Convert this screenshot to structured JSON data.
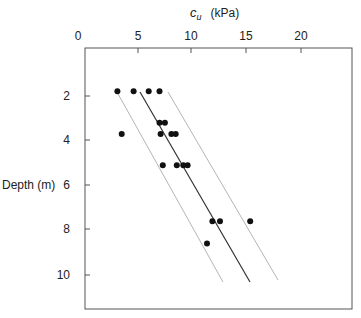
{
  "chart_data": {
    "type": "scatter",
    "title": "",
    "xlabel": "c_u (kPa)",
    "xlabel_symbol": "c",
    "xlabel_subscript": "u",
    "xlabel_units": "(kPa)",
    "ylabel": "Depth (m)",
    "x_axis_position": "top",
    "y_axis_inverted": true,
    "xlim": [
      0,
      24.7
    ],
    "ylim": [
      0,
      11.5
    ],
    "x_ticks": [
      0,
      5,
      10,
      15,
      20
    ],
    "y_ticks": [
      2,
      4,
      6,
      8,
      10
    ],
    "grid": false,
    "legend": null,
    "series": [
      {
        "name": "measured",
        "type": "scatter",
        "points": [
          {
            "x": 3.0,
            "y": 1.8
          },
          {
            "x": 4.5,
            "y": 1.8
          },
          {
            "x": 5.9,
            "y": 1.8
          },
          {
            "x": 6.9,
            "y": 1.8
          },
          {
            "x": 6.9,
            "y": 3.2
          },
          {
            "x": 7.4,
            "y": 3.2
          },
          {
            "x": 3.4,
            "y": 3.7
          },
          {
            "x": 7.0,
            "y": 3.7
          },
          {
            "x": 8.0,
            "y": 3.7
          },
          {
            "x": 8.4,
            "y": 3.7
          },
          {
            "x": 7.2,
            "y": 5.1
          },
          {
            "x": 8.5,
            "y": 5.1
          },
          {
            "x": 9.1,
            "y": 5.1
          },
          {
            "x": 9.5,
            "y": 5.1
          },
          {
            "x": 11.8,
            "y": 7.6
          },
          {
            "x": 12.5,
            "y": 7.6
          },
          {
            "x": 15.3,
            "y": 7.6
          },
          {
            "x": 11.3,
            "y": 8.6
          }
        ]
      },
      {
        "name": "mean trend",
        "type": "line",
        "style": "solid",
        "color": "#333333",
        "points": [
          {
            "x": 5.1,
            "y": 1.8
          },
          {
            "x": 15.3,
            "y": 10.3
          }
        ]
      },
      {
        "name": "lower bound",
        "type": "line",
        "style": "thin",
        "color": "#b0b0b0",
        "points": [
          {
            "x": 3.0,
            "y": 1.8
          },
          {
            "x": 12.8,
            "y": 10.3
          }
        ]
      },
      {
        "name": "upper bound",
        "type": "line",
        "style": "thin",
        "color": "#b0b0b0",
        "points": [
          {
            "x": 7.7,
            "y": 1.8
          },
          {
            "x": 17.9,
            "y": 10.2
          }
        ]
      }
    ]
  },
  "labels": {
    "x_title_symbol": "c",
    "x_title_sub": "u",
    "x_title_units": "(kPa)",
    "y_title": "Depth (m)",
    "x_tick_0": "0",
    "x_tick_5": "5",
    "x_tick_10": "10",
    "x_tick_15": "15",
    "x_tick_20": "20",
    "y_tick_2": "2",
    "y_tick_4": "4",
    "y_tick_6": "6",
    "y_tick_8": "8",
    "y_tick_10": "10"
  }
}
